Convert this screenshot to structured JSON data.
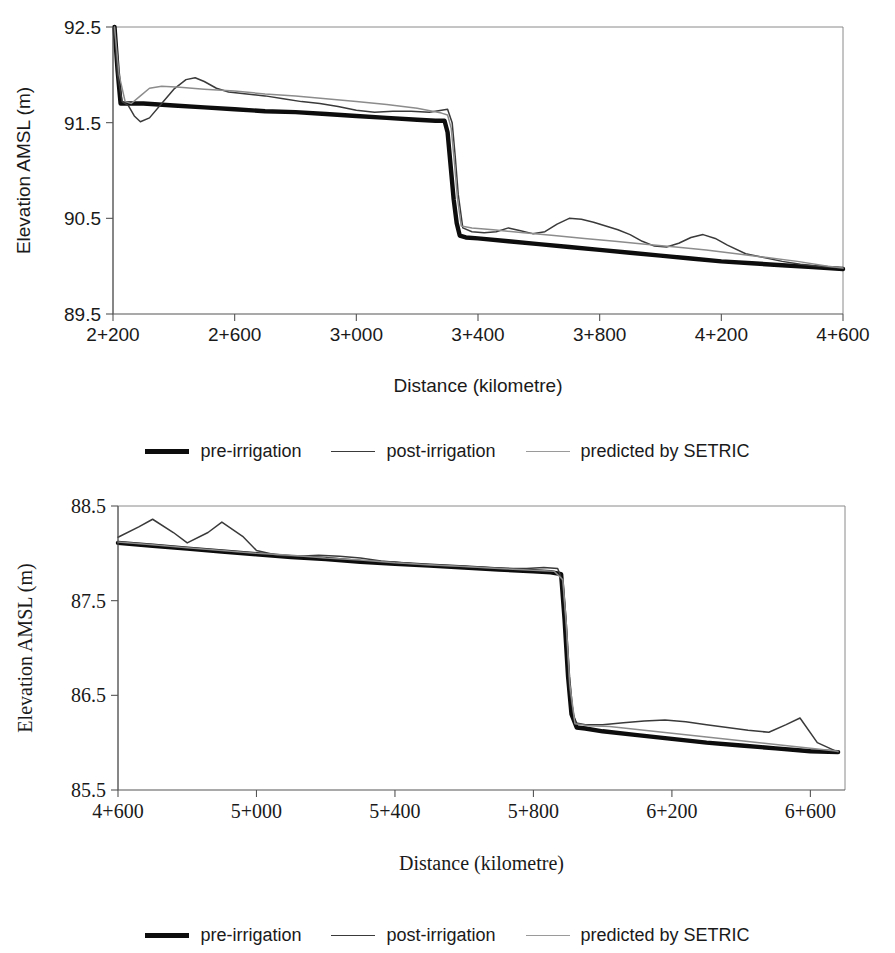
{
  "colors": {
    "pre_irrigation": "#0d0d0d",
    "post_irrigation": "#3a3a3a",
    "predicted_setric": "#9a9a9a",
    "axis": "#555555",
    "frame": "#8a8a8a",
    "background": "#ffffff"
  },
  "legend": {
    "items": [
      {
        "label": "pre-irrigation",
        "key": "pre"
      },
      {
        "label": "post-irrigation",
        "key": "post"
      },
      {
        "label": "predicted by SETRIC",
        "key": "setric"
      }
    ]
  },
  "chart_data": [
    {
      "id": "top",
      "type": "line",
      "title": "",
      "xlabel": "Distance (kilometre)",
      "ylabel": "Elevation AMSL (m)",
      "font_style": "sans-serif",
      "grid": false,
      "legend_position": "below",
      "xlim": [
        2200,
        4600
      ],
      "ylim": [
        89.5,
        92.5
      ],
      "xticks": [
        2200,
        2600,
        3000,
        3400,
        3800,
        4200,
        4600
      ],
      "xticklabels": [
        "2+200",
        "2+600",
        "3+000",
        "3+400",
        "3+800",
        "4+200",
        "4+600"
      ],
      "yticks": [
        89.5,
        90.5,
        91.5,
        92.5
      ],
      "yticklabels": [
        "89.5",
        "90.5",
        "91.5",
        "92.5"
      ],
      "series": [
        {
          "name": "pre-irrigation",
          "key": "pre",
          "x": [
            2205,
            2215,
            2225,
            2240,
            2260,
            2300,
            2400,
            2500,
            2600,
            2700,
            2800,
            2900,
            3000,
            3100,
            3200,
            3260,
            3290,
            3300,
            3310,
            3320,
            3330,
            3340,
            3360,
            3400,
            3500,
            3600,
            3700,
            3800,
            3900,
            4000,
            4100,
            4200,
            4300,
            4400,
            4500,
            4600
          ],
          "y": [
            92.5,
            92.05,
            91.7,
            91.7,
            91.7,
            91.7,
            91.68,
            91.66,
            91.64,
            91.62,
            91.61,
            91.59,
            91.57,
            91.55,
            91.53,
            91.52,
            91.52,
            91.4,
            91.05,
            90.7,
            90.45,
            90.32,
            90.3,
            90.29,
            90.26,
            90.23,
            90.2,
            90.17,
            90.14,
            90.11,
            90.08,
            90.05,
            90.03,
            90.01,
            89.99,
            89.97
          ]
        },
        {
          "name": "post-irrigation",
          "key": "post",
          "x": [
            2205,
            2215,
            2230,
            2250,
            2270,
            2290,
            2320,
            2360,
            2400,
            2440,
            2470,
            2500,
            2540,
            2580,
            2640,
            2700,
            2760,
            2820,
            2880,
            2940,
            3000,
            3060,
            3120,
            3180,
            3240,
            3280,
            3300,
            3315,
            3325,
            3335,
            3350,
            3380,
            3420,
            3460,
            3500,
            3540,
            3580,
            3620,
            3660,
            3700,
            3740,
            3780,
            3820,
            3860,
            3900,
            3940,
            3980,
            4020,
            4060,
            4100,
            4140,
            4180,
            4220,
            4280,
            4340,
            4400,
            4460,
            4520,
            4600
          ],
          "y": [
            92.5,
            92.0,
            91.72,
            91.68,
            91.57,
            91.51,
            91.55,
            91.7,
            91.85,
            91.95,
            91.97,
            91.93,
            91.86,
            91.82,
            91.8,
            91.78,
            91.75,
            91.72,
            91.7,
            91.67,
            91.63,
            91.61,
            91.62,
            91.62,
            91.61,
            91.63,
            91.64,
            91.5,
            91.15,
            90.75,
            90.4,
            90.36,
            90.35,
            90.36,
            90.4,
            90.37,
            90.34,
            90.36,
            90.44,
            90.5,
            90.49,
            90.46,
            90.42,
            90.38,
            90.33,
            90.26,
            90.21,
            90.2,
            90.24,
            90.3,
            90.33,
            90.29,
            90.22,
            90.13,
            90.09,
            90.05,
            90.02,
            90.0,
            89.98
          ]
        },
        {
          "name": "predicted by SETRIC",
          "key": "setric",
          "x": [
            2205,
            2220,
            2240,
            2260,
            2290,
            2320,
            2360,
            2420,
            2500,
            2600,
            2700,
            2800,
            2900,
            3000,
            3100,
            3200,
            3280,
            3300,
            3312,
            3322,
            3332,
            3345,
            3380,
            3450,
            3550,
            3650,
            3750,
            3850,
            3950,
            4050,
            4150,
            4250,
            4350,
            4450,
            4550,
            4600
          ],
          "y": [
            92.5,
            92.0,
            91.72,
            91.7,
            91.78,
            91.86,
            91.88,
            91.87,
            91.85,
            91.83,
            91.8,
            91.78,
            91.75,
            91.72,
            91.69,
            91.65,
            91.6,
            91.58,
            91.44,
            91.1,
            90.72,
            90.42,
            90.4,
            90.38,
            90.35,
            90.32,
            90.29,
            90.26,
            90.23,
            90.2,
            90.17,
            90.13,
            90.09,
            90.05,
            90.0,
            89.98
          ]
        }
      ]
    },
    {
      "id": "bottom",
      "type": "line",
      "title": "",
      "xlabel": "Distance (kilometre)",
      "ylabel": "Elevation AMSL (m)",
      "font_style": "serif",
      "grid": false,
      "legend_position": "below",
      "xlim": [
        4600,
        6700
      ],
      "ylim": [
        85.5,
        88.5
      ],
      "xticks": [
        4600,
        5000,
        5400,
        5800,
        6200,
        6600
      ],
      "xticklabels": [
        "4+600",
        "5+000",
        "5+400",
        "5+800",
        "6+200",
        "6+600"
      ],
      "yticks": [
        85.5,
        86.5,
        87.5,
        88.5
      ],
      "yticklabels": [
        "85.5",
        "86.5",
        "87.5",
        "88.5"
      ],
      "series": [
        {
          "name": "pre-irrigation",
          "key": "pre",
          "x": [
            4600,
            4700,
            4800,
            4900,
            5000,
            5100,
            5200,
            5300,
            5400,
            5500,
            5600,
            5700,
            5800,
            5850,
            5880,
            5890,
            5900,
            5910,
            5925,
            5950,
            6000,
            6100,
            6200,
            6300,
            6400,
            6500,
            6600,
            6680
          ],
          "y": [
            88.11,
            88.08,
            88.05,
            88.02,
            87.99,
            87.96,
            87.94,
            87.91,
            87.89,
            87.87,
            87.85,
            87.83,
            87.81,
            87.8,
            87.78,
            87.3,
            86.7,
            86.3,
            86.16,
            86.15,
            86.12,
            86.08,
            86.04,
            86.0,
            85.97,
            85.94,
            85.91,
            85.9
          ]
        },
        {
          "name": "post-irrigation",
          "key": "post",
          "x": [
            4600,
            4660,
            4700,
            4760,
            4800,
            4860,
            4900,
            4960,
            5000,
            5060,
            5120,
            5180,
            5240,
            5300,
            5360,
            5420,
            5480,
            5540,
            5600,
            5660,
            5720,
            5780,
            5830,
            5870,
            5885,
            5895,
            5905,
            5920,
            5950,
            6000,
            6060,
            6120,
            6180,
            6240,
            6300,
            6360,
            6420,
            6480,
            6530,
            6570,
            6620,
            6680
          ],
          "y": [
            88.17,
            88.28,
            88.36,
            88.22,
            88.11,
            88.22,
            88.33,
            88.18,
            88.03,
            87.98,
            87.97,
            87.98,
            87.97,
            87.95,
            87.92,
            87.9,
            87.88,
            87.87,
            87.86,
            87.85,
            87.84,
            87.84,
            87.85,
            87.84,
            87.7,
            87.2,
            86.55,
            86.21,
            86.19,
            86.19,
            86.21,
            86.23,
            86.24,
            86.22,
            86.19,
            86.16,
            86.13,
            86.11,
            86.19,
            86.26,
            86.0,
            85.9
          ]
        },
        {
          "name": "predicted by SETRIC",
          "key": "setric",
          "x": [
            4600,
            4700,
            4800,
            4900,
            5000,
            5100,
            5200,
            5300,
            5400,
            5500,
            5600,
            5700,
            5800,
            5860,
            5885,
            5895,
            5905,
            5920,
            5960,
            6020,
            6100,
            6200,
            6300,
            6400,
            6500,
            6600,
            6680
          ],
          "y": [
            88.12,
            88.09,
            88.06,
            88.03,
            88.0,
            87.98,
            87.95,
            87.93,
            87.9,
            87.88,
            87.86,
            87.84,
            87.82,
            87.81,
            87.72,
            87.25,
            86.62,
            86.2,
            86.18,
            86.17,
            86.14,
            86.1,
            86.06,
            86.02,
            85.98,
            85.94,
            85.91
          ]
        }
      ]
    }
  ]
}
